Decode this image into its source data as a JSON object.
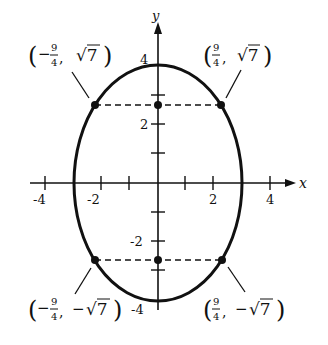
{
  "figure": {
    "type": "ellipse-graph",
    "equation_hint": "x^2/9 + y^2/16 = 1",
    "axes": {
      "x_label": "x",
      "y_label": "y",
      "x_ticks": [
        "-4",
        "-2",
        "2",
        "4"
      ],
      "y_ticks": [
        "4",
        "2",
        "-2",
        "-4"
      ]
    },
    "points": [
      {
        "label_sign": "−",
        "num": "9",
        "den": "4",
        "y_text": "√7",
        "y_sign": ""
      },
      {
        "label_sign": "",
        "num": "9",
        "den": "4",
        "y_text": "√7",
        "y_sign": ""
      },
      {
        "label_sign": "−",
        "num": "9",
        "den": "4",
        "y_text": "√7",
        "y_sign": "−"
      },
      {
        "label_sign": "",
        "num": "9",
        "den": "4",
        "y_text": "√7",
        "y_sign": "−"
      }
    ],
    "colors": {
      "stroke": "#111111",
      "background": "#ffffff"
    }
  }
}
